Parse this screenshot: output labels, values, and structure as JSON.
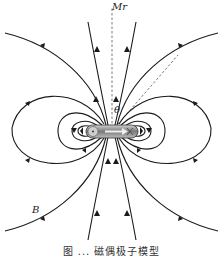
{
  "diagram": {
    "labels": {
      "axis_label": "r",
      "axis_prefix": "M",
      "field_label": "B",
      "theta_label": "θ"
    },
    "caption": "图 ... 磁偶极子模型",
    "colors": {
      "line": "#1a1a1a",
      "dashed": "#555555",
      "magnet_body": "#8a8a8a",
      "background": "#ffffff"
    },
    "elements": {
      "magnet": "horizontal bar magnet with rounded ends at center",
      "dipole_arrow": "arrow inside magnet pointing right",
      "axis": "dashed vertical line from magnet up to label",
      "radius": "dashed diagonal line from magnet to upper right"
    }
  }
}
